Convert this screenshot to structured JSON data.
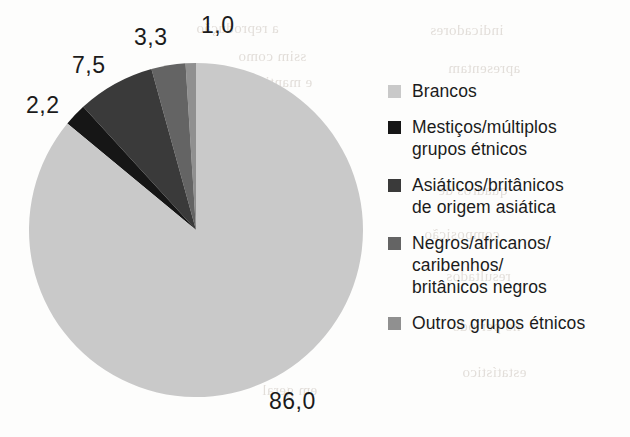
{
  "chart_data": {
    "type": "pie",
    "title": "",
    "subtitle": "",
    "xlabel": "",
    "ylabel": "",
    "legend_position": "right",
    "grid": false,
    "units": "percent",
    "decimal_separator": ",",
    "start_angle_deg": 0,
    "direction": "counterclockwise",
    "total": 100.0,
    "categories": [
      "Brancos",
      "Mestiços/múltiplos grupos étnicos",
      "Asiáticos/britânicos de origem asiática",
      "Negros/africanos/caribenhos/britânicos negros",
      "Outros grupos étnicos"
    ],
    "values": [
      86.0,
      2.2,
      7.5,
      3.3,
      1.0
    ],
    "value_labels": [
      "86,0",
      "2,2",
      "7,5",
      "3,3",
      "1,0"
    ],
    "colors": [
      "#c9c9c9",
      "#161616",
      "#3a3a3a",
      "#646464",
      "#909090"
    ],
    "slices": [
      {
        "label": "Outros grupos étnicos",
        "value": 1.0,
        "value_label": "1,0",
        "color": "#909090",
        "start_deg": 0.0,
        "end_deg": 3.6,
        "label_x": 201,
        "label_y": 12
      },
      {
        "label": "Negros/africanos/caribenhos/britânicos negros",
        "value": 3.3,
        "value_label": "3,3",
        "color": "#646464",
        "start_deg": 3.6,
        "end_deg": 15.48,
        "label_x": 134,
        "label_y": 24
      },
      {
        "label": "Asiáticos/britânicos de origem asiática",
        "value": 7.5,
        "value_label": "7,5",
        "color": "#3a3a3a",
        "start_deg": 15.48,
        "end_deg": 42.48,
        "label_x": 72,
        "label_y": 52
      },
      {
        "label": "Mestiços/múltiplos grupos étnicos",
        "value": 2.2,
        "value_label": "2,2",
        "color": "#161616",
        "start_deg": 42.48,
        "end_deg": 50.4,
        "label_x": 26,
        "label_y": 92
      },
      {
        "label": "Brancos",
        "value": 86.0,
        "value_label": "86,0",
        "color": "#c9c9c9",
        "start_deg": 50.4,
        "end_deg": 360.0,
        "label_x": 269,
        "label_y": 388
      }
    ],
    "geometry": {
      "center_x": 168,
      "center_y": 168,
      "radius": 167
    }
  },
  "legend": {
    "items": [
      {
        "label": "Brancos",
        "color": "#c9c9c9"
      },
      {
        "label": "Mestiços/múltiplos\ngrupos étnicos",
        "color": "#161616"
      },
      {
        "label": "Asiáticos/britânicos\nde origem asiática",
        "color": "#3a3a3a"
      },
      {
        "label": "Negros/africanos/\ncaribenhos/\nbritânicos negros",
        "color": "#646464"
      },
      {
        "label": "Outros grupos étnicos",
        "color": "#909090"
      }
    ]
  },
  "bleed_through": {
    "lines": [
      {
        "text": "a reprodução",
        "x": 196,
        "y": 20
      },
      {
        "text": "ssim como",
        "x": 238,
        "y": 48
      },
      {
        "text": "e mantida",
        "x": 250,
        "y": 74
      },
      {
        "text": "a completo",
        "x": 214,
        "y": 122
      },
      {
        "text": "no exemplo",
        "x": 206,
        "y": 176
      },
      {
        "text": "de acordo",
        "x": 222,
        "y": 214
      },
      {
        "text": "as tabelas",
        "x": 236,
        "y": 252
      },
      {
        "text": "destacadas",
        "x": 216,
        "y": 296
      },
      {
        "text": "o trabalho",
        "x": 244,
        "y": 338
      },
      {
        "text": "em geral",
        "x": 262,
        "y": 382
      },
      {
        "text": "indicadores",
        "x": 430,
        "y": 22
      },
      {
        "text": "apresentam",
        "x": 448,
        "y": 60
      },
      {
        "text": "quadros de",
        "x": 438,
        "y": 182
      },
      {
        "text": "composição",
        "x": 424,
        "y": 226
      },
      {
        "text": "resultados",
        "x": 446,
        "y": 268
      },
      {
        "text": "no período",
        "x": 452,
        "y": 318
      },
      {
        "text": "estatístico",
        "x": 462,
        "y": 364
      }
    ]
  }
}
